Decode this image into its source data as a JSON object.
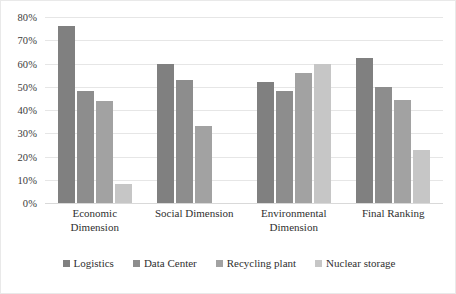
{
  "chart_data": {
    "type": "bar",
    "title": "",
    "subtitle": "",
    "xlabel": "",
    "ylabel": "",
    "ylim": [
      0,
      80
    ],
    "grid": true,
    "legend_position": "bottom",
    "value_format": "percent",
    "categories": [
      "Economic Dimension",
      "Social Dimension",
      "Environmental Dimension",
      "Final Ranking"
    ],
    "y_ticks": [
      80,
      70,
      60,
      50,
      40,
      30,
      20,
      10,
      0
    ],
    "y_tick_labels": [
      "80%",
      "70%",
      "60%",
      "50%",
      "40%",
      "30%",
      "20%",
      "10%",
      "0%"
    ],
    "series": [
      {
        "name": "Logistics",
        "color": "#808080",
        "values": [
          76,
          60,
          52,
          62.5
        ]
      },
      {
        "name": "Data Center",
        "color": "#8d8d8d",
        "values": [
          48,
          53,
          48,
          50
        ]
      },
      {
        "name": "Recycling plant",
        "color": "#a2a2a2",
        "values": [
          44,
          33,
          56,
          44.5
        ]
      },
      {
        "name": "Nuclear storage",
        "color": "#c6c6c6",
        "values": [
          8,
          0,
          60,
          23
        ]
      }
    ]
  },
  "legend": {
    "items": [
      {
        "label": "Logistics",
        "color": "#808080"
      },
      {
        "label": "Data Center",
        "color": "#8d8d8d"
      },
      {
        "label": "Recycling plant",
        "color": "#a2a2a2"
      },
      {
        "label": "Nuclear storage",
        "color": "#c6c6c6"
      }
    ]
  }
}
